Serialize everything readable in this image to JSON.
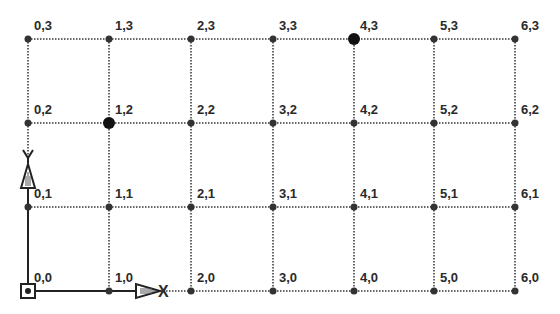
{
  "diagram": {
    "type": "coordinate-grid",
    "columns": 7,
    "rows": 4,
    "column_x": [
      28,
      109,
      191,
      273,
      354,
      434,
      515
    ],
    "row_y": [
      291,
      207,
      123,
      39
    ],
    "points": [
      {
        "label": "0,0",
        "col": 0,
        "row": 0,
        "highlighted": false
      },
      {
        "label": "1,0",
        "col": 1,
        "row": 0,
        "highlighted": false
      },
      {
        "label": "2,0",
        "col": 2,
        "row": 0,
        "highlighted": false
      },
      {
        "label": "3,0",
        "col": 3,
        "row": 0,
        "highlighted": false
      },
      {
        "label": "4,0",
        "col": 4,
        "row": 0,
        "highlighted": false
      },
      {
        "label": "5,0",
        "col": 5,
        "row": 0,
        "highlighted": false
      },
      {
        "label": "6,0",
        "col": 6,
        "row": 0,
        "highlighted": false
      },
      {
        "label": "0,1",
        "col": 0,
        "row": 1,
        "highlighted": false
      },
      {
        "label": "1,1",
        "col": 1,
        "row": 1,
        "highlighted": false
      },
      {
        "label": "2,1",
        "col": 2,
        "row": 1,
        "highlighted": false
      },
      {
        "label": "3,1",
        "col": 3,
        "row": 1,
        "highlighted": false
      },
      {
        "label": "4,1",
        "col": 4,
        "row": 1,
        "highlighted": false
      },
      {
        "label": "5,1",
        "col": 5,
        "row": 1,
        "highlighted": false
      },
      {
        "label": "6,1",
        "col": 6,
        "row": 1,
        "highlighted": false
      },
      {
        "label": "0,2",
        "col": 0,
        "row": 2,
        "highlighted": false
      },
      {
        "label": "1,2",
        "col": 1,
        "row": 2,
        "highlighted": true
      },
      {
        "label": "2,2",
        "col": 2,
        "row": 2,
        "highlighted": false
      },
      {
        "label": "3,2",
        "col": 3,
        "row": 2,
        "highlighted": false
      },
      {
        "label": "4,2",
        "col": 4,
        "row": 2,
        "highlighted": false
      },
      {
        "label": "5,2",
        "col": 5,
        "row": 2,
        "highlighted": false
      },
      {
        "label": "6,2",
        "col": 6,
        "row": 2,
        "highlighted": false
      },
      {
        "label": "0,3",
        "col": 0,
        "row": 3,
        "highlighted": false
      },
      {
        "label": "1,3",
        "col": 1,
        "row": 3,
        "highlighted": false
      },
      {
        "label": "2,3",
        "col": 2,
        "row": 3,
        "highlighted": false
      },
      {
        "label": "3,3",
        "col": 3,
        "row": 3,
        "highlighted": false
      },
      {
        "label": "4,3",
        "col": 4,
        "row": 3,
        "highlighted": true
      },
      {
        "label": "5,3",
        "col": 5,
        "row": 3,
        "highlighted": false
      },
      {
        "label": "6,3",
        "col": 6,
        "row": 3,
        "highlighted": false
      }
    ],
    "axes": {
      "x_label": "X",
      "y_label": "Y"
    },
    "colors": {
      "grid_line": "#333333",
      "point": "#333333",
      "highlight": "#111111",
      "axis": "#222222",
      "label": "#2a2a2a"
    }
  }
}
